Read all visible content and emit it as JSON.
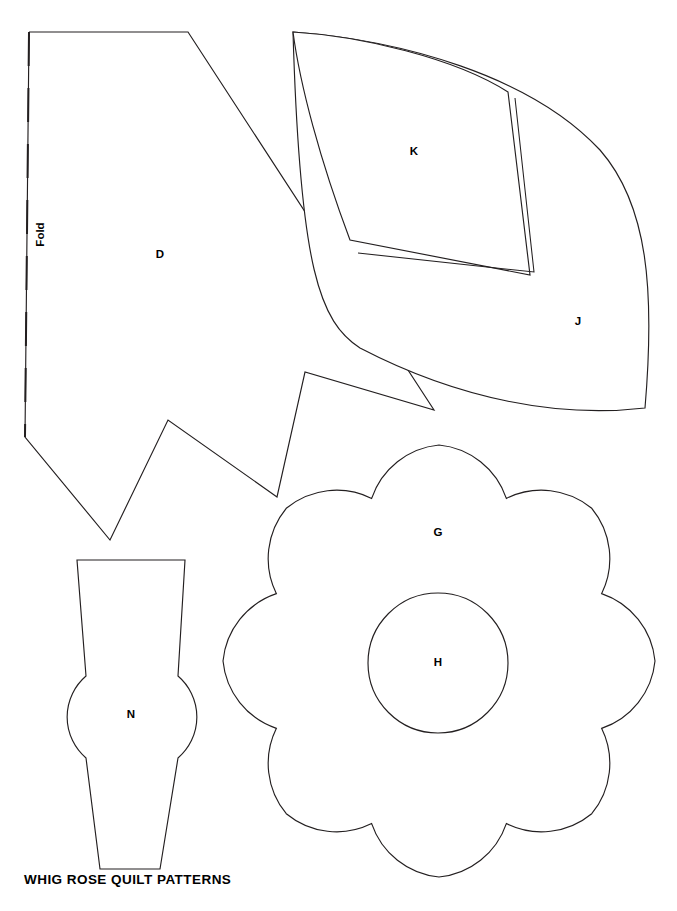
{
  "document": {
    "title": "WHIG ROSE QUILT PATTERNS",
    "caption": "WHIG ROSE QUILT PATTERNS",
    "background_color": "#ffffff",
    "line_color": "#231f20",
    "page_width": 677,
    "page_height": 911
  },
  "annotations": {
    "fold_label": "Fold"
  },
  "pieces": [
    {
      "id": "D",
      "label": "D",
      "name": "piece-d",
      "description": "Large angular leaf-stem template with dashed fold edge on the left and a zigzag lower contour ending in a point at right",
      "label_x": 160,
      "label_y": 255,
      "outline": "M 29,32 L 188,32 L 434,410 L 305,372 L 277,497 L 168,420 L 110,540 L 25,437 L 29,32",
      "has_fold_edge": true
    },
    {
      "id": "K",
      "label": "K",
      "name": "piece-k",
      "description": "Curved quadrilateral petal template nested inside piece J, drawn with a narrow double outline strip on its right and lower edges",
      "label_x": 414,
      "label_y": 152,
      "outline": "M 293,32 C 360,36 455,58 508,92 L 530,275 L 350,240 C 320,160 300,85 293,32 Z",
      "inner_strip": "M 515,98 L 534,272 L 358,253"
    },
    {
      "id": "J",
      "label": "J",
      "name": "piece-j",
      "description": "Large curved leaf template surrounding piece K, with a rounded right side and sweeping lower curve",
      "label_x": 578,
      "label_y": 322,
      "outline": "M 293,32 C 400,40 530,75 600,150 C 648,205 655,290 645,408 C 560,418 460,400 360,348 C 320,322 300,270 293,32 Z"
    },
    {
      "id": "G",
      "label": "G",
      "name": "piece-g",
      "description": "Eight-petal scalloped rose flower template",
      "label_x": 438,
      "label_y": 533,
      "petal_count": 8,
      "center_x": 439,
      "center_y": 661,
      "outer_radius": 216,
      "inner_radius": 176
    },
    {
      "id": "H",
      "label": "H",
      "name": "piece-h",
      "description": "Circular flower-center template",
      "label_x": 438,
      "label_y": 663,
      "center_x": 438,
      "center_y": 663,
      "radius": 70
    },
    {
      "id": "N",
      "label": "N",
      "name": "piece-n",
      "description": "Bud or calyx template: tapered trapezoid top, round bulb at middle, narrow tapered stem at bottom",
      "label_x": 131,
      "label_y": 715,
      "outline": "M 77,560 L 185,560 L 178,676 A 54 54 0 0 1 178,758 L 160,869 L 100,869 L 86,758 A 54 54 0 0 1 86,676 L 77,560 Z"
    }
  ]
}
